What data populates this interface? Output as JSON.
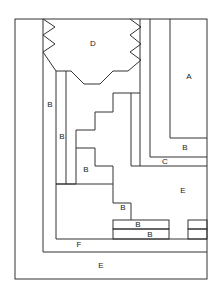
{
  "diagram": {
    "labels": {
      "a": "A",
      "d": "D",
      "b_left_outer": "B",
      "b_left_inner": "B",
      "b_stair": "B",
      "b_right": "B",
      "c": "C",
      "e_mid": "E",
      "b_low": "B",
      "b_bar1": "B",
      "b_bar2": "B",
      "f": "F",
      "e_bottom": "E"
    },
    "colors": {
      "line": "#333333",
      "background": "#ffffff"
    }
  }
}
